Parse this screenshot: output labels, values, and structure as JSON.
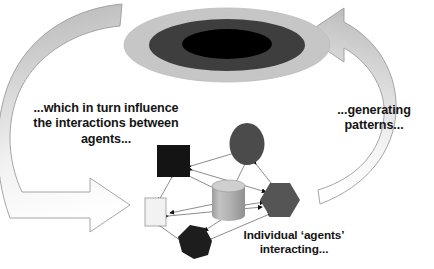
{
  "diagram": {
    "captions": {
      "left": "...which in turn influence\nthe interactions between\nagents...",
      "right": "...generating\npatterns...",
      "bottom": "Individual ‘agents’\ninteracting..."
    },
    "pattern_blob": {
      "name": "emergent-pattern-ellipse",
      "rings": [
        {
          "label": "outer-ring",
          "color": "#c6c6c6",
          "rx": 103,
          "ry": 37
        },
        {
          "label": "middle-ring",
          "color": "#3e3e3e",
          "rx": 78,
          "ry": 26
        },
        {
          "label": "inner-core",
          "color": "#000000",
          "rx": 45,
          "ry": 15
        }
      ],
      "center_x": 227,
      "center_y": 45
    },
    "arrows": [
      {
        "name": "downward-influence-arrow",
        "direction": "clockwise-left-descending",
        "meaning": "patterns influence agent interactions",
        "fill_top": "#b9b9b9",
        "fill_bottom": "#fdfdfd",
        "stroke": "#9a9a9a"
      },
      {
        "name": "upward-emergence-arrow",
        "direction": "counterclockwise-right-ascending",
        "meaning": "agent interactions generate patterns",
        "fill_top": "#b9b9b9",
        "fill_bottom": "#fdfdfd",
        "stroke": "#9a9a9a"
      }
    ],
    "network": {
      "edge_color": "#8d8d8d",
      "arrowhead_color": "#101010",
      "nodes": [
        {
          "id": "n1",
          "name": "agent-node-square-black",
          "shape": "square",
          "color": "#141414",
          "x": 173,
          "y": 160,
          "w": 33,
          "h": 32
        },
        {
          "id": "n2",
          "name": "agent-node-ellipse-dark",
          "shape": "ellipse",
          "color": "#4b4b4b",
          "x": 247,
          "y": 144,
          "w": 35,
          "h": 42
        },
        {
          "id": "n3",
          "name": "agent-node-cylinder-light",
          "shape": "cylinder",
          "color": "#b3b3b3",
          "x": 228,
          "y": 197,
          "w": 33,
          "h": 38
        },
        {
          "id": "n4",
          "name": "agent-node-hexagon-gray",
          "shape": "hexagon",
          "color": "#555555",
          "x": 280,
          "y": 198,
          "w": 39,
          "h": 34
        },
        {
          "id": "n5",
          "name": "agent-node-rectangle-white",
          "shape": "rectangle",
          "color": "#f2f2f2",
          "x": 155,
          "y": 211,
          "w": 21,
          "h": 28
        },
        {
          "id": "n6",
          "name": "agent-node-heptagon-black",
          "shape": "heptagon",
          "color": "#1d1d1d",
          "x": 194,
          "y": 241,
          "w": 35,
          "h": 34
        }
      ],
      "edges": [
        {
          "from": "n1",
          "to": "n2",
          "bidirectional": true
        },
        {
          "from": "n1",
          "to": "n3",
          "bidirectional": true
        },
        {
          "from": "n1",
          "to": "n5",
          "bidirectional": true
        },
        {
          "from": "n1",
          "to": "n4",
          "bidirectional": true
        },
        {
          "from": "n2",
          "to": "n3",
          "bidirectional": true
        },
        {
          "from": "n2",
          "to": "n4",
          "bidirectional": true
        },
        {
          "from": "n3",
          "to": "n4",
          "bidirectional": true
        },
        {
          "from": "n3",
          "to": "n5",
          "bidirectional": true
        },
        {
          "from": "n3",
          "to": "n6",
          "bidirectional": true
        },
        {
          "from": "n5",
          "to": "n6",
          "bidirectional": true
        },
        {
          "from": "n6",
          "to": "n4",
          "bidirectional": true
        }
      ]
    }
  }
}
